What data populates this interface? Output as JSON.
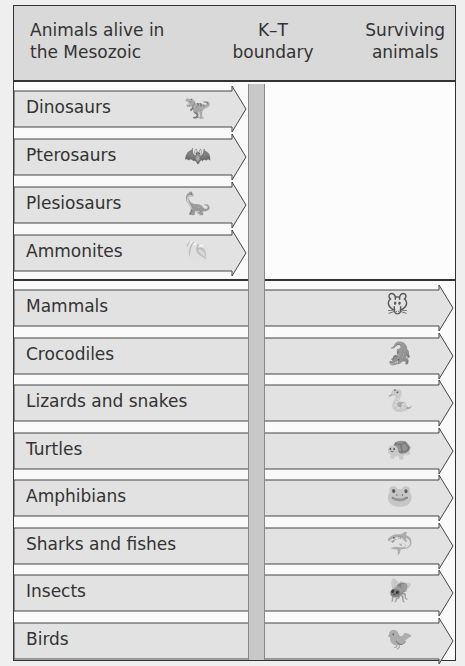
{
  "header": {
    "left_line1": "Animals alive in",
    "left_line2": "the Mesozoic",
    "mid_line1": "K–T",
    "mid_line2": "boundary",
    "right_line1": "Surviving",
    "right_line2": "animals"
  },
  "extinct_animals": [
    {
      "label": "Dinosaurs",
      "icon": "dinosaur-icon",
      "glyph": "🦖"
    },
    {
      "label": "Pterosaurs",
      "icon": "pterosaur-icon",
      "glyph": "🦇"
    },
    {
      "label": "Plesiosaurs",
      "icon": "plesiosaur-icon",
      "glyph": "🦕"
    },
    {
      "label": "Ammonites",
      "icon": "ammonite-icon",
      "glyph": "🐚"
    }
  ],
  "surviving_animals": [
    {
      "label": "Mammals",
      "icon": "mouse-icon",
      "glyph": "🐭"
    },
    {
      "label": "Crocodiles",
      "icon": "crocodile-icon",
      "glyph": "🐊"
    },
    {
      "label": "Lizards and snakes",
      "icon": "snake-icon",
      "glyph": "🐍"
    },
    {
      "label": "Turtles",
      "icon": "turtle-icon",
      "glyph": "🐢"
    },
    {
      "label": "Amphibians",
      "icon": "frog-icon",
      "glyph": "🐸"
    },
    {
      "label": "Sharks and fishes",
      "icon": "shark-icon",
      "glyph": "🦈"
    },
    {
      "label": "Insects",
      "icon": "dragonfly-icon",
      "glyph": "🪰"
    },
    {
      "label": "Birds",
      "icon": "bird-icon",
      "glyph": "🐦"
    }
  ],
  "colors": {
    "header_bg": "#d9d9d9",
    "arrow_fill": "#e2e2e2",
    "kt_bar": "#c8c8c8",
    "border": "#333333"
  }
}
